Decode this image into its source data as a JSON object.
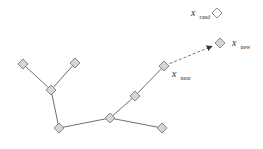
{
  "diagram": {
    "type": "tree-expansion",
    "colors": {
      "edge": "#6f6f6f",
      "node_fill": "#cfd8d4",
      "node_fill_empty": "#ffffff",
      "background": "#ffffff"
    },
    "nodes": [
      {
        "id": "a",
        "x": 23,
        "y": 64,
        "fill": "#cfd8d4"
      },
      {
        "id": "b",
        "x": 75,
        "y": 63,
        "fill": "#cfd8d4"
      },
      {
        "id": "c",
        "x": 51,
        "y": 90,
        "fill": "#cfd8d4"
      },
      {
        "id": "d",
        "x": 59,
        "y": 128,
        "fill": "#cfd8d4"
      },
      {
        "id": "e",
        "x": 110,
        "y": 118,
        "fill": "#cfd8d4"
      },
      {
        "id": "f",
        "x": 162,
        "y": 128,
        "fill": "#cfd8d4"
      },
      {
        "id": "g",
        "x": 135,
        "y": 96,
        "fill": "#cfd8d4"
      },
      {
        "id": "x_near",
        "x": 164,
        "y": 66,
        "fill": "#cfd8d4"
      },
      {
        "id": "x_new",
        "x": 220,
        "y": 43,
        "fill": "#cfd8d4"
      },
      {
        "id": "x_rand",
        "x": 217,
        "y": 13,
        "fill": "#ffffff"
      }
    ],
    "edges": [
      {
        "from": "a",
        "to": "c"
      },
      {
        "from": "b",
        "to": "c"
      },
      {
        "from": "c",
        "to": "d"
      },
      {
        "from": "d",
        "to": "e"
      },
      {
        "from": "e",
        "to": "f"
      },
      {
        "from": "e",
        "to": "g"
      },
      {
        "from": "g",
        "to": "x_near"
      }
    ],
    "extension": {
      "from": "x_near",
      "to": "x_new",
      "style": "dashed-arrow"
    },
    "labels": {
      "x_rand": {
        "main": "x",
        "sub": "rand"
      },
      "x_new": {
        "main": "x",
        "sub": "new"
      },
      "x_near": {
        "main": "x",
        "sub": "near"
      }
    }
  }
}
